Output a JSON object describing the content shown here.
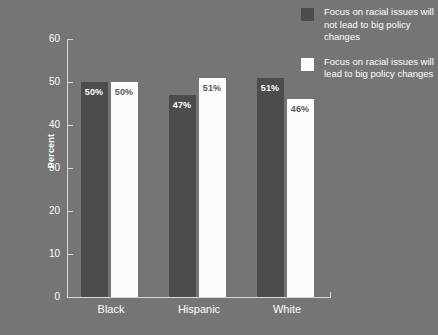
{
  "chart_data": {
    "type": "bar",
    "title": "",
    "subtitle": "",
    "xlabel": "",
    "ylabel": "Percent",
    "ylim": [
      0,
      60
    ],
    "yticks": [
      0,
      10,
      20,
      30,
      40,
      50,
      60
    ],
    "ytick_labels": [
      "0",
      "10",
      "20",
      "30",
      "40",
      "50",
      "60"
    ],
    "grid": false,
    "legend_position": "top-right",
    "categories": [
      "Black",
      "Hispanic",
      "White"
    ],
    "series": [
      {
        "name": "Focus on racial issues will not lead to big policy changes",
        "color": "#4c4c4c",
        "values": [
          50,
          47,
          51
        ],
        "value_labels": [
          "50%",
          "47%",
          "51%"
        ]
      },
      {
        "name": "Focus on racial issues will lead to big policy changes",
        "color": "#fcfcfc",
        "values": [
          50,
          51,
          46
        ],
        "value_labels": [
          "50%",
          "51%",
          "46%"
        ]
      }
    ]
  },
  "legend": {
    "items": [
      {
        "swatch": "dark",
        "label": "Focus on racial issues will not lead to big policy changes"
      },
      {
        "swatch": "light",
        "label": "Focus on racial issues will lead to big policy changes"
      }
    ]
  },
  "colors": {
    "background": "#757575",
    "series_dark": "#4c4c4c",
    "series_light": "#fcfcfc",
    "axis": "#d8d8d8",
    "text": "#ffffff",
    "dark_label_text": "#5a5a5a"
  }
}
